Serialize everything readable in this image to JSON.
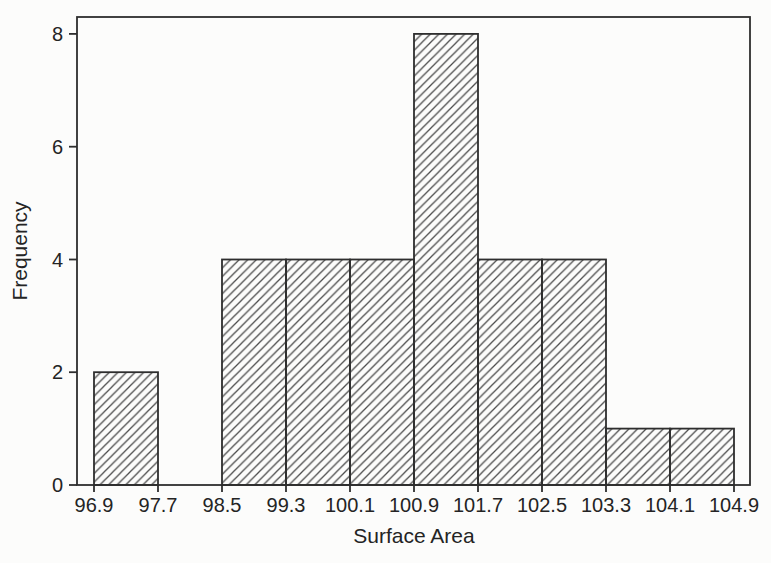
{
  "figure": {
    "background": "#fcfcfb",
    "line_color": "#2e2e2e",
    "hatch_color": "#4c4c4c",
    "text_color": "#242424"
  },
  "chart_data": {
    "type": "bar",
    "subtype": "histogram",
    "title": "",
    "xlabel": "Surface Area",
    "ylabel": "Frequency",
    "bin_edges": [
      96.9,
      97.7,
      98.5,
      99.3,
      100.1,
      100.9,
      101.7,
      102.5,
      103.3,
      104.1,
      104.9
    ],
    "x_tick_labels": [
      "96.9",
      "97.7",
      "98.5",
      "99.3",
      "100.1",
      "100.9",
      "101.7",
      "102.5",
      "103.3",
      "104.1",
      "104.9"
    ],
    "frequencies": [
      2,
      0,
      4,
      4,
      4,
      8,
      4,
      4,
      1,
      1
    ],
    "y_ticks": [
      0,
      2,
      4,
      6,
      8
    ],
    "ylim": [
      0,
      8.3
    ],
    "grid": false,
    "legend": null,
    "bar_style": "diagonal-hatch",
    "frame": "full-box"
  }
}
